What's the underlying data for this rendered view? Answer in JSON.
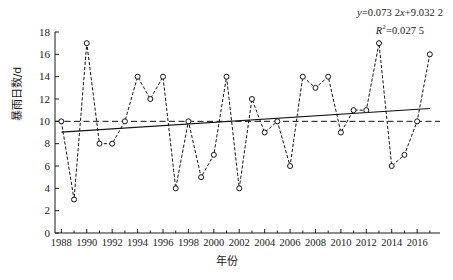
{
  "chart_data": {
    "type": "line",
    "title": "",
    "xlabel": "年份",
    "ylabel": "暴雨日数/d",
    "xlim": [
      1987.5,
      2017.8
    ],
    "ylim": [
      0,
      18
    ],
    "ytick_step": 2,
    "yticks": [
      "0",
      "2",
      "4",
      "6",
      "8",
      "10",
      "12",
      "14",
      "16",
      "18"
    ],
    "xticks": [
      "1988",
      "1990",
      "1992",
      "1994",
      "1996",
      "1998",
      "2000",
      "2002",
      "2004",
      "2006",
      "2008",
      "2010",
      "2012",
      "2014",
      "2016"
    ],
    "x": [
      1988,
      1989,
      1990,
      1991,
      1992,
      1993,
      1994,
      1995,
      1996,
      1997,
      1998,
      1999,
      2000,
      2001,
      2002,
      2003,
      2004,
      2005,
      2006,
      2007,
      2008,
      2009,
      2010,
      2011,
      2012,
      2013,
      2014,
      2015,
      2016,
      2017
    ],
    "series": [
      {
        "name": "暴雨日数",
        "marker": "open-circle",
        "linestyle": "dashed",
        "values": [
          10,
          3,
          17,
          8,
          8,
          10,
          14,
          12,
          14,
          4,
          10,
          5,
          7,
          14,
          4,
          12,
          9,
          10,
          6,
          14,
          13,
          14,
          9,
          11,
          11,
          17,
          6,
          7,
          10,
          16
        ]
      }
    ],
    "trend_line": {
      "name": "linear-trend",
      "slope": 0.0732,
      "intercept": 9.0322,
      "x_start": 1988,
      "x_end": 2017,
      "y_start": 9.03,
      "y_end": 11.15,
      "linestyle": "solid"
    },
    "mean_line": {
      "name": "mean-reference",
      "value": 10.0,
      "linestyle": "dashed"
    },
    "grid": false,
    "legend": "none"
  },
  "annotation": {
    "equation_y": "y",
    "equation_body": "=0.073 2",
    "equation_x": "x",
    "equation_tail": "+9.032 2",
    "r2_symbol": "R",
    "r2_sup": "2",
    "r2_value": "=0.027 5"
  }
}
